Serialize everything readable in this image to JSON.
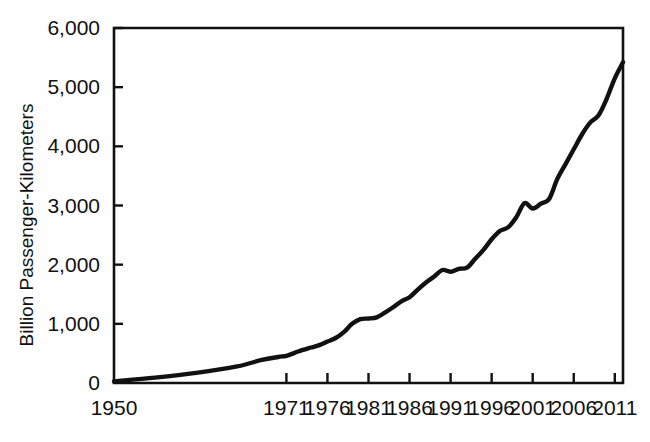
{
  "chart_data": {
    "type": "line",
    "title": "",
    "subtitle": "",
    "xlabel": "",
    "ylabel": "Billion Passenger-Kilometers",
    "xlim": [
      1950,
      2012
    ],
    "ylim": [
      0,
      6000
    ],
    "grid": false,
    "legend": null,
    "x_tick_labels": [
      "1950",
      "1971",
      "1976",
      "1981",
      "1986",
      "1991",
      "1996",
      "2001",
      "2006",
      "2011"
    ],
    "x_tick_values": [
      1950,
      1971,
      1976,
      1981,
      1986,
      1991,
      1996,
      2001,
      2006,
      2011
    ],
    "y_tick_labels": [
      "0",
      "1,000",
      "2,000",
      "3,000",
      "4,000",
      "5,000",
      "6,000"
    ],
    "y_tick_values": [
      0,
      1000,
      2000,
      3000,
      4000,
      5000,
      6000
    ],
    "series": [
      {
        "name": "World air traffic",
        "color": "#111111",
        "x": [
          1950,
          1955,
          1960,
          1965,
          1968,
          1970,
          1971,
          1972,
          1973,
          1974,
          1975,
          1976,
          1977,
          1978,
          1979,
          1980,
          1981,
          1982,
          1983,
          1984,
          1985,
          1986,
          1987,
          1988,
          1989,
          1990,
          1991,
          1992,
          1993,
          1994,
          1995,
          1996,
          1997,
          1998,
          1999,
          2000,
          2001,
          2002,
          2003,
          2004,
          2005,
          2006,
          2007,
          2008,
          2009,
          2010,
          2011,
          2012
        ],
        "y": [
          28,
          90,
          170,
          280,
          390,
          440,
          460,
          510,
          560,
          600,
          640,
          700,
          760,
          860,
          1000,
          1080,
          1090,
          1110,
          1190,
          1280,
          1380,
          1450,
          1580,
          1700,
          1800,
          1910,
          1880,
          1930,
          1950,
          2100,
          2250,
          2430,
          2570,
          2630,
          2800,
          3040,
          2950,
          3030,
          3110,
          3450,
          3700,
          3950,
          4200,
          4400,
          4520,
          4800,
          5150,
          5420
        ]
      }
    ]
  },
  "axes": {
    "y_axis_title": "Billion Passenger-Kilometers"
  }
}
